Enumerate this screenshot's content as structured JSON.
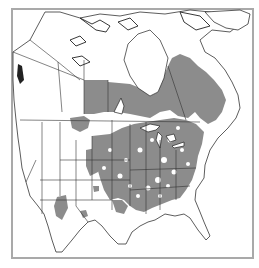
{
  "map": {
    "type": "species-range-map",
    "region": "North America",
    "colors": {
      "range_fill": "#8c8c8c",
      "land": "#ffffff",
      "border": "#333333",
      "frame": "#a9a9a9",
      "background": "#ffffff"
    },
    "range_areas": [
      "Central and eastern Canada (Manitoba, Ontario, Quebec, Saskatchewan east)",
      "Eastern United States (patchy, dense)",
      "Great Plains (patchy)",
      "Arizona (isolated patch)",
      "New Mexico (isolated patch)",
      "Colorado / Wyoming (isolated patches)"
    ]
  }
}
